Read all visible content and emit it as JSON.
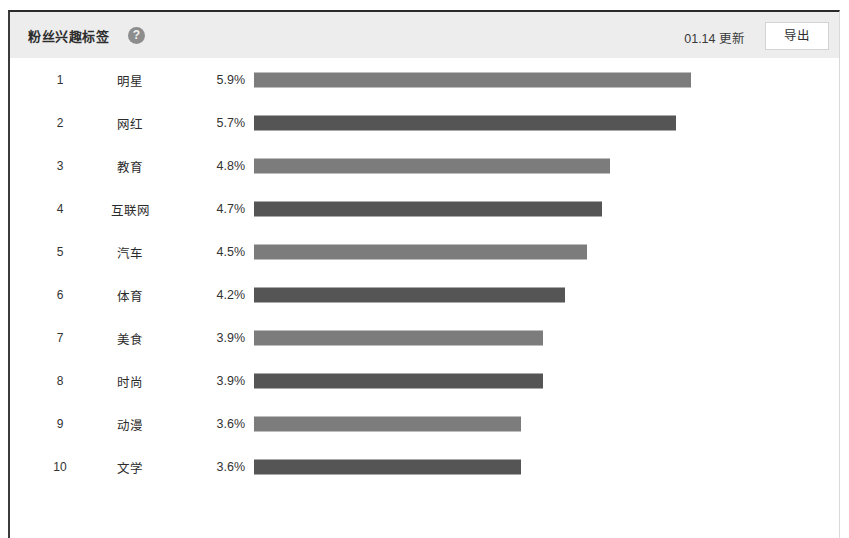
{
  "header": {
    "title": "粉丝兴趣标签",
    "help_icon": "?",
    "update_label": "01.14 更新",
    "export_label": "导出"
  },
  "colors": {
    "header_bg": "#ededed",
    "bar_light": "#7c7c7c",
    "bar_dark": "#555555",
    "card_bg": "#ffffff",
    "text": "#2d2d2d"
  },
  "chart_data": {
    "type": "bar",
    "orientation": "horizontal",
    "title": "粉丝兴趣标签",
    "xlabel": "",
    "ylabel": "",
    "grid": false,
    "legend": "none",
    "xlim": [
      0,
      5.9
    ],
    "categories": [
      "明星",
      "网红",
      "教育",
      "互联网",
      "汽车",
      "体育",
      "美食",
      "时尚",
      "动漫",
      "文学"
    ],
    "values": [
      5.9,
      5.7,
      4.8,
      4.7,
      4.5,
      4.2,
      3.9,
      3.9,
      3.6,
      3.6
    ],
    "value_labels": [
      "5.9%",
      "5.7%",
      "4.8%",
      "4.7%",
      "4.5%",
      "4.2%",
      "3.9%",
      "3.9%",
      "3.6%",
      "3.6%"
    ],
    "ranks": [
      "1",
      "2",
      "3",
      "4",
      "5",
      "6",
      "7",
      "8",
      "9",
      "10"
    ],
    "bar_colors": [
      "#7c7c7c",
      "#555555",
      "#7c7c7c",
      "#555555",
      "#7c7c7c",
      "#555555",
      "#7c7c7c",
      "#555555",
      "#7c7c7c",
      "#555555"
    ]
  },
  "rows": [
    {
      "rank": "1",
      "label": "明星",
      "pct": "5.9%",
      "value": 5.9,
      "shade": ""
    },
    {
      "rank": "2",
      "label": "网红",
      "pct": "5.7%",
      "value": 5.7,
      "shade": "dark"
    },
    {
      "rank": "3",
      "label": "教育",
      "pct": "4.8%",
      "value": 4.8,
      "shade": ""
    },
    {
      "rank": "4",
      "label": "互联网",
      "pct": "4.7%",
      "value": 4.7,
      "shade": "dark"
    },
    {
      "rank": "5",
      "label": "汽车",
      "pct": "4.5%",
      "value": 4.5,
      "shade": ""
    },
    {
      "rank": "6",
      "label": "体育",
      "pct": "4.2%",
      "value": 4.2,
      "shade": "dark"
    },
    {
      "rank": "7",
      "label": "美食",
      "pct": "3.9%",
      "value": 3.9,
      "shade": ""
    },
    {
      "rank": "8",
      "label": "时尚",
      "pct": "3.9%",
      "value": 3.9,
      "shade": "dark"
    },
    {
      "rank": "9",
      "label": "动漫",
      "pct": "3.6%",
      "value": 3.6,
      "shade": ""
    },
    {
      "rank": "10",
      "label": "文学",
      "pct": "3.6%",
      "value": 3.6,
      "shade": "dark"
    }
  ]
}
